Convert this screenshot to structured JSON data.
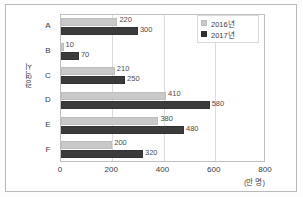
{
  "chart_data": {
    "type": "bar",
    "orientation": "horizontal",
    "title": "",
    "xlabel": "(만 명)",
    "ylabel": "광역시",
    "categories": [
      "A",
      "B",
      "C",
      "D",
      "E",
      "F"
    ],
    "series": [
      {
        "name": "2016년",
        "color": "#c9c9c9",
        "values": [
          220,
          10,
          210,
          410,
          380,
          200
        ]
      },
      {
        "name": "2017년",
        "color": "#3b3b3b",
        "values": [
          300,
          70,
          250,
          580,
          480,
          320
        ]
      }
    ],
    "xlim": [
      0,
      800
    ],
    "xticks": [
      0,
      200,
      400,
      600,
      800
    ],
    "xtick_labels": [
      "0",
      "200",
      "400",
      "600",
      "800"
    ],
    "grid": true,
    "legend_position": "top-right",
    "data_labels": {
      "A": [
        "220",
        "300"
      ],
      "B": [
        "10",
        "70"
      ],
      "C": [
        "210",
        "250"
      ],
      "D": [
        "410",
        "580"
      ],
      "E": [
        "380",
        "480"
      ],
      "F": [
        "200",
        "320"
      ]
    }
  },
  "legend": {
    "items": [
      {
        "label": "2016년",
        "color": "#c9c9c9"
      },
      {
        "label": "2017년",
        "color": "#3b3b3b"
      }
    ]
  },
  "axes": {
    "y_title": "광역시",
    "x_unit": "(만 명)"
  }
}
